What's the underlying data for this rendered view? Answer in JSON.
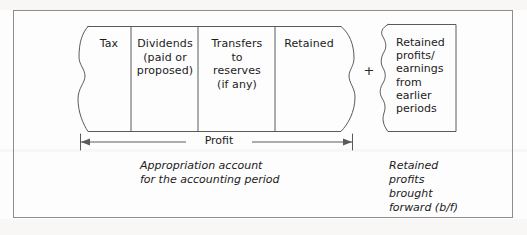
{
  "figure": {
    "type": "accounting-appropriation-diagram",
    "background_color": "#fdfdfd",
    "line_color": "#5a5a5a",
    "frame_color": "#8d8d8d",
    "text_color": "#1b1b1b"
  },
  "profit_block": {
    "cells": [
      {
        "id": "tax",
        "label": "Tax"
      },
      {
        "id": "dividends",
        "label": "Dividends\n(paid or\nproposed)"
      },
      {
        "id": "transfers",
        "label": "Transfers\nto\nreserves\n(if any)"
      },
      {
        "id": "retained",
        "label": "Retained"
      }
    ],
    "measure_label": "Profit",
    "caption": "Appropriation account\nfor the accounting period"
  },
  "operator": {
    "symbol": "+"
  },
  "brought_forward_block": {
    "label": "Retained\nprofits/\nearnings\nfrom\nearlier\nperiods",
    "caption": "Retained\nprofits\nbrought\nforward (b/f)"
  }
}
